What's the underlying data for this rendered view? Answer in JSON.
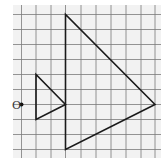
{
  "diagram": {
    "type": "enlargement-on-grid",
    "grid": {
      "background": "#f2f2f2",
      "line_color": "#7a7a7a",
      "x0": 13,
      "y0": 5,
      "x1": 161,
      "y1": 158,
      "vertical_lines": [
        21.5,
        36,
        51,
        65.5,
        81,
        96,
        111,
        126,
        141,
        155
      ],
      "horizontal_lines": [
        14.5,
        29.5,
        44.5,
        59.5,
        74.5,
        89.5,
        104.5,
        119.5,
        134.5,
        149.5
      ]
    },
    "center": {
      "label": "O",
      "point": [
        21.5,
        104.5
      ],
      "label_pos": [
        12,
        109
      ]
    },
    "small_triangle": {
      "name": "object",
      "vertices": [
        [
          36,
          74.5
        ],
        [
          36,
          119.5
        ],
        [
          65.5,
          104.5
        ]
      ],
      "stroke": "#1a1a1a"
    },
    "large_triangle": {
      "name": "image",
      "vertices": [
        [
          65.5,
          14.5
        ],
        [
          65.5,
          149.5
        ],
        [
          155,
          104.5
        ]
      ],
      "stroke": "#1a1a1a"
    }
  }
}
